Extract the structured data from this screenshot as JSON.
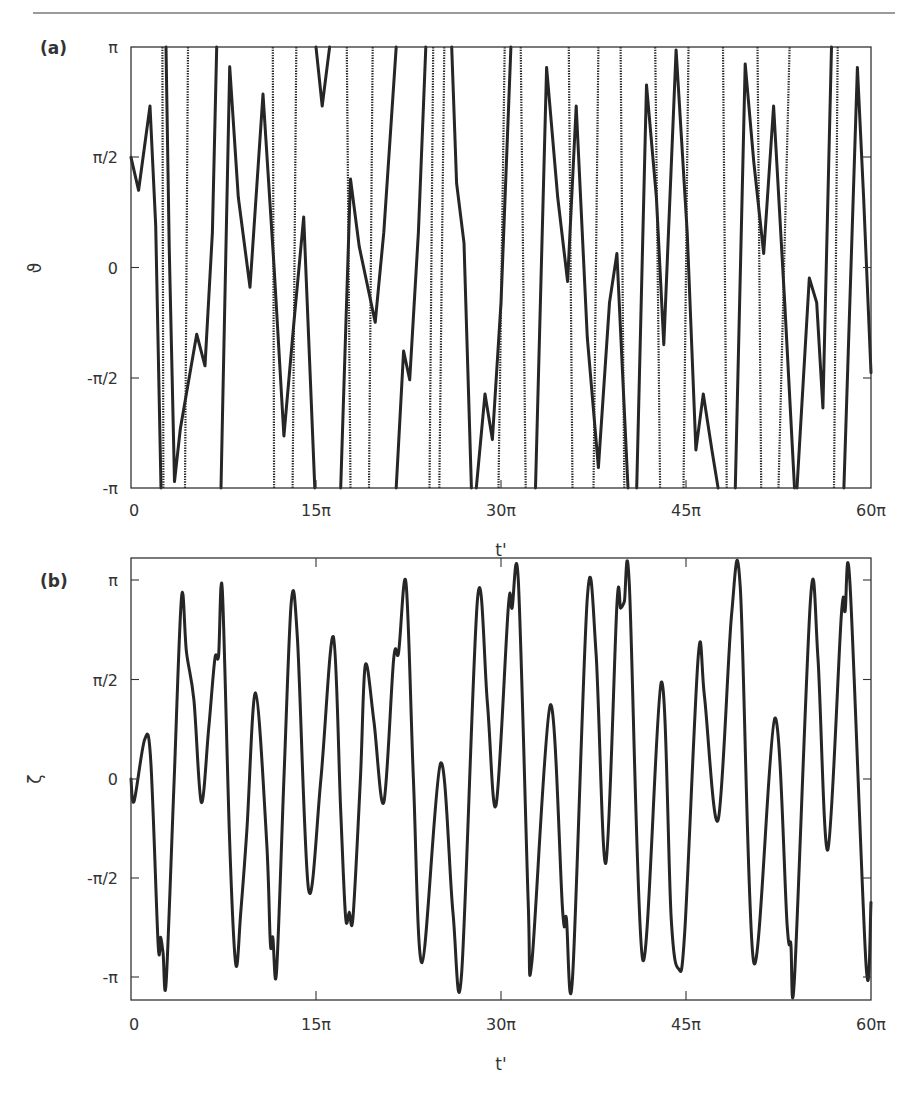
{
  "chart_data": [
    {
      "panel": "(a)",
      "type": "line",
      "title": "",
      "xlabel": "t'",
      "ylabel": "ϑ",
      "x_unit": "π",
      "xlim": [
        0,
        60
      ],
      "ylim": [
        -3.14159,
        3.14159
      ],
      "xticks": [
        0,
        15,
        30,
        45,
        60
      ],
      "xtick_labels": [
        "0",
        "15π",
        "30π",
        "45π",
        "60π"
      ],
      "yticks": [
        3.14159,
        1.5708,
        0,
        -1.5708,
        -3.14159
      ],
      "ytick_labels": [
        "π",
        "π/2",
        "0",
        "-π/2",
        "-π"
      ],
      "grid": false,
      "legend": null,
      "note": "Angle wrapped to [-π, π]; near-vertical lines are rapid full rotations / wraps. Segments given as [t (units of π), ϑ (rad)].",
      "segments": [
        [
          [
            0,
            1.57
          ],
          [
            0.62,
            1.1
          ],
          [
            1.54,
            2.3
          ],
          [
            2.0,
            0.6
          ],
          [
            2.43,
            -3.14
          ]
        ],
        [
          [
            2.55,
            3.14
          ],
          [
            2.63,
            -3.14
          ]
        ],
        [
          [
            2.84,
            3.14
          ],
          [
            3.1,
            0.3
          ],
          [
            3.53,
            -3.05
          ],
          [
            4.0,
            -2.3
          ],
          [
            5.33,
            -0.95
          ],
          [
            6.0,
            -1.4
          ],
          [
            6.6,
            0.5
          ],
          [
            6.95,
            3.14
          ]
        ],
        [
          [
            4.38,
            -3.14
          ],
          [
            4.62,
            3.14
          ]
        ],
        [
          [
            7.3,
            -3.14
          ],
          [
            8.0,
            2.86
          ],
          [
            8.7,
            1.0
          ],
          [
            9.65,
            -0.28
          ],
          [
            10.7,
            2.47
          ],
          [
            11.6,
            0.0
          ],
          [
            12.4,
            -2.4
          ],
          [
            13.2,
            -0.8
          ],
          [
            14.0,
            0.72
          ],
          [
            14.9,
            -3.14
          ]
        ],
        [
          [
            11.5,
            3.14
          ],
          [
            11.6,
            -3.14
          ]
        ],
        [
          [
            13.1,
            -3.14
          ],
          [
            13.4,
            3.14
          ]
        ],
        [
          [
            15.0,
            3.14
          ],
          [
            15.5,
            2.3
          ],
          [
            16.1,
            3.14
          ]
        ],
        [
          [
            17.5,
            3.14
          ],
          [
            17.8,
            -3.14
          ]
        ],
        [
          [
            17.0,
            -3.14
          ],
          [
            17.8,
            1.26
          ],
          [
            18.5,
            0.3
          ],
          [
            19.8,
            -0.78
          ],
          [
            20.5,
            0.5
          ],
          [
            21.5,
            3.14
          ]
        ],
        [
          [
            19.3,
            -3.14
          ],
          [
            19.6,
            3.14
          ]
        ],
        [
          [
            21.5,
            -3.14
          ],
          [
            22.1,
            -1.19
          ],
          [
            22.6,
            -1.6
          ],
          [
            23.3,
            0.5
          ],
          [
            23.9,
            3.14
          ]
        ],
        [
          [
            24.2,
            -3.14
          ],
          [
            24.5,
            3.14
          ]
        ],
        [
          [
            25.0,
            -3.14
          ],
          [
            25.4,
            3.14
          ]
        ],
        [
          [
            26.0,
            3.14
          ],
          [
            26.4,
            1.2
          ],
          [
            27.0,
            0.35
          ],
          [
            27.6,
            -3.14
          ]
        ],
        [
          [
            28.0,
            -3.14
          ],
          [
            28.7,
            -1.8
          ],
          [
            29.3,
            -2.45
          ],
          [
            30.0,
            -0.5
          ],
          [
            30.8,
            3.14
          ]
        ],
        [
          [
            29.8,
            -3.14
          ],
          [
            30.3,
            3.14
          ]
        ],
        [
          [
            31.6,
            3.14
          ],
          [
            32.0,
            -3.14
          ]
        ],
        [
          [
            32.8,
            -3.14
          ],
          [
            33.7,
            2.85
          ],
          [
            34.6,
            1.0
          ],
          [
            35.4,
            -0.2
          ],
          [
            36.1,
            2.3
          ],
          [
            37.0,
            -1.0
          ],
          [
            37.9,
            -2.85
          ],
          [
            38.8,
            -0.5
          ],
          [
            39.4,
            0.2
          ],
          [
            40.3,
            -3.14
          ]
        ],
        [
          [
            35.5,
            3.14
          ],
          [
            35.8,
            -3.14
          ]
        ],
        [
          [
            37.5,
            -3.14
          ],
          [
            37.9,
            3.14
          ]
        ],
        [
          [
            39.7,
            3.14
          ],
          [
            40.0,
            -3.14
          ]
        ],
        [
          [
            41.0,
            -3.14
          ],
          [
            41.8,
            2.6
          ],
          [
            42.6,
            1.0
          ],
          [
            43.2,
            -1.1
          ],
          [
            44.2,
            3.1
          ],
          [
            45.1,
            0.5
          ],
          [
            45.8,
            -2.6
          ],
          [
            46.4,
            -1.8
          ],
          [
            47.1,
            -2.6
          ],
          [
            47.6,
            -3.14
          ]
        ],
        [
          [
            42.5,
            3.14
          ],
          [
            42.9,
            -3.14
          ]
        ],
        [
          [
            44.8,
            -3.14
          ],
          [
            45.2,
            3.14
          ]
        ],
        [
          [
            48.0,
            3.14
          ],
          [
            48.3,
            -3.14
          ]
        ],
        [
          [
            49.0,
            -3.14
          ],
          [
            49.8,
            2.9
          ],
          [
            50.5,
            1.5
          ],
          [
            51.3,
            0.2
          ],
          [
            52.1,
            2.3
          ],
          [
            53.0,
            -0.5
          ],
          [
            53.8,
            -3.14
          ]
        ],
        [
          [
            50.8,
            3.14
          ],
          [
            51.1,
            -3.14
          ]
        ],
        [
          [
            52.5,
            -3.14
          ],
          [
            53.4,
            3.14
          ]
        ],
        [
          [
            54.0,
            -3.14
          ],
          [
            55.0,
            -0.15
          ],
          [
            55.6,
            -0.5
          ],
          [
            56.1,
            -2.0
          ],
          [
            56.8,
            3.14
          ]
        ],
        [
          [
            57.0,
            -3.14
          ],
          [
            57.3,
            3.14
          ]
        ],
        [
          [
            57.8,
            -3.14
          ],
          [
            58.9,
            2.85
          ],
          [
            59.4,
            1.0
          ],
          [
            60.0,
            -1.5
          ]
        ]
      ]
    },
    {
      "panel": "(b)",
      "type": "line",
      "title": "",
      "xlabel": "t'",
      "ylabel": "ζ",
      "x_unit": "π",
      "xlim": [
        0,
        60
      ],
      "ylim": [
        -3.5,
        3.5
      ],
      "xticks": [
        0,
        15,
        30,
        45,
        60
      ],
      "xtick_labels": [
        "0",
        "15π",
        "30π",
        "45π",
        "60π"
      ],
      "yticks": [
        3.14159,
        1.5708,
        0,
        -1.5708,
        -3.14159
      ],
      "ytick_labels": [
        "π",
        "π/2",
        "0",
        "-π/2",
        "-π"
      ],
      "grid": false,
      "legend": null,
      "x": [
        0,
        0.25,
        1.1,
        1.6,
        2.2,
        2.4,
        2.6,
        2.85,
        3.5,
        4.1,
        4.5,
        5.1,
        5.7,
        6.3,
        6.8,
        7.1,
        7.4,
        8.0,
        8.5,
        8.9,
        9.4,
        10.1,
        11.0,
        11.3,
        11.5,
        11.8,
        12.4,
        13.0,
        13.5,
        14.4,
        15.4,
        16.4,
        17.0,
        17.4,
        17.7,
        18.0,
        18.6,
        19.0,
        19.7,
        20.5,
        21.3,
        21.7,
        22.3,
        22.9,
        23.6,
        25.1,
        26.1,
        26.8,
        28.1,
        28.9,
        29.6,
        30.6,
        30.9,
        31.4,
        32.2,
        32.5,
        34.0,
        35.0,
        35.3,
        35.8,
        37.0,
        37.7,
        38.5,
        39.4,
        39.7,
        40.0,
        40.4,
        41.5,
        43.0,
        43.8,
        44.4,
        44.9,
        46.0,
        46.5,
        47.6,
        48.7,
        49.4,
        50.5,
        52.2,
        53.2,
        53.5,
        53.8,
        55.1,
        55.7,
        56.5,
        57.6,
        57.9,
        58.3,
        59.6,
        60.0
      ],
      "values": [
        0,
        -0.35,
        0.62,
        0.3,
        -2.6,
        -2.5,
        -2.75,
        -3.2,
        0.0,
        2.88,
        2.0,
        1.25,
        -0.37,
        0.8,
        1.9,
        1.95,
        2.99,
        -1.0,
        -2.93,
        -2.1,
        -0.8,
        1.36,
        -1.0,
        -2.6,
        -2.5,
        -3.05,
        0.0,
        2.8,
        2.2,
        -1.75,
        0.0,
        2.25,
        -0.5,
        -2.18,
        -2.1,
        -2.18,
        0.0,
        1.8,
        0.9,
        -0.37,
        1.9,
        2.0,
        3.1,
        0.0,
        -2.9,
        0.25,
        -2.1,
        -3.1,
        2.86,
        1.2,
        -0.41,
        2.73,
        2.7,
        3.14,
        -1.9,
        -2.9,
        1.17,
        -2.1,
        -2.2,
        -3.15,
        2.86,
        2.0,
        -1.33,
        2.75,
        2.7,
        2.8,
        3.08,
        -2.86,
        1.53,
        -2.2,
        -3.0,
        -2.4,
        1.95,
        1.3,
        -0.65,
        2.6,
        3.02,
        -2.9,
        0.96,
        -2.3,
        -2.6,
        -3.14,
        2.86,
        1.9,
        -1.12,
        2.6,
        2.65,
        3.08,
        -2.95,
        -1.95
      ]
    }
  ],
  "panels": {
    "a": {
      "label": "(a)",
      "ylabel": "ϑ",
      "xlabel": "t'",
      "ytick_labels": [
        "π",
        "π/2",
        "0",
        "-π/2",
        "-π"
      ],
      "xtick_labels": [
        "0",
        "15π",
        "30π",
        "45π",
        "60π"
      ]
    },
    "b": {
      "label": "(b)",
      "ylabel": "ζ",
      "xlabel": "t'",
      "ytick_labels": [
        "π",
        "π/2",
        "0",
        "-π/2",
        "-π"
      ],
      "xtick_labels": [
        "0",
        "15π",
        "30π",
        "45π",
        "60π"
      ]
    }
  }
}
